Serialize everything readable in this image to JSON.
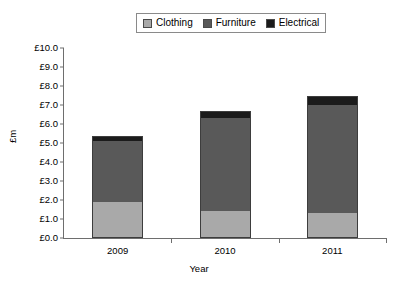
{
  "chart_data": {
    "type": "bar",
    "stacked": true,
    "title": "",
    "xlabel": "Year",
    "ylabel": "£m",
    "categories": [
      "2009",
      "2010",
      "2011"
    ],
    "series": [
      {
        "name": "Clothing",
        "color": "#a9a9a9",
        "values": [
          1.9,
          1.4,
          1.3
        ]
      },
      {
        "name": "Furniture",
        "color": "#595959",
        "values": [
          3.2,
          4.9,
          5.7
        ]
      },
      {
        "name": "Electrical",
        "color": "#1b1b1b",
        "values": [
          0.25,
          0.4,
          0.5
        ]
      }
    ],
    "totals": [
      5.35,
      6.7,
      7.5
    ],
    "ylim": [
      0,
      10
    ],
    "ytick_step": 1,
    "ytick_labels": [
      "£10.0",
      "£9.0",
      "£8.0",
      "£7.0",
      "£6.0",
      "£5.0",
      "£4.0",
      "£3.0",
      "£2.0",
      "£1.0",
      "£0.0"
    ],
    "ytick_values": [
      10,
      9,
      8,
      7,
      6,
      5,
      4,
      3,
      2,
      1,
      0
    ],
    "grid": false,
    "legend_position": "top-center"
  },
  "legend": {
    "entries": [
      {
        "label": "Clothing",
        "color": "#a9a9a9"
      },
      {
        "label": "Furniture",
        "color": "#595959"
      },
      {
        "label": "Electrical",
        "color": "#1b1b1b"
      }
    ]
  }
}
